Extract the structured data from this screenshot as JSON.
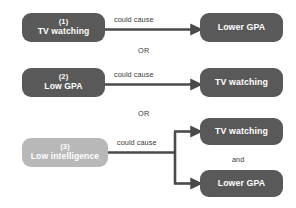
{
  "diagram": {
    "colors": {
      "node_dark": "#595959",
      "node_light": "#b8b8b8",
      "arrow": "#4a4a4a",
      "text_on_node": "#ffffff",
      "label_text": "#3b3b3b",
      "background": "#ffffff"
    },
    "connector_label": "could cause",
    "or_separator": "OR",
    "and_separator": "and",
    "rows": [
      {
        "index": "(1)",
        "cause": {
          "label": "TV watching",
          "style": "dark"
        },
        "connector": "could cause",
        "effects": [
          {
            "label": "Lower GPA",
            "style": "dark"
          }
        ],
        "branching": false
      },
      {
        "index": "(2)",
        "cause": {
          "label": "Low GPA",
          "style": "dark"
        },
        "connector": "could cause",
        "effects": [
          {
            "label": "TV watching",
            "style": "dark"
          }
        ],
        "branching": false
      },
      {
        "index": "(3)",
        "cause": {
          "label": "Low intelligence",
          "style": "light"
        },
        "connector": "could cause",
        "effects": [
          {
            "label": "TV watching",
            "style": "dark"
          },
          {
            "label": "Lower GPA",
            "style": "dark"
          }
        ],
        "branching": true,
        "effect_joiner": "and"
      }
    ],
    "separators": [
      {
        "label": "OR",
        "after_row": 1
      },
      {
        "label": "OR",
        "after_row": 2
      }
    ]
  }
}
